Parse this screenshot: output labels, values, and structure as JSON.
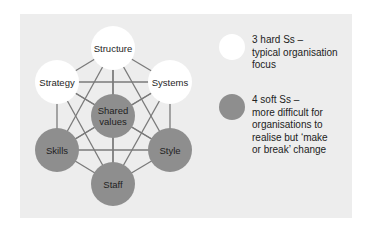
{
  "colors": {
    "panel_bg": "#ededed",
    "hard_fill": "#ffffff",
    "soft_fill": "#8e8e8e",
    "line": "#7a7a7a"
  },
  "diagram": {
    "nodes": [
      {
        "id": "structure",
        "label": "Structure",
        "type": "hard",
        "cx": 113,
        "cy": 48
      },
      {
        "id": "strategy",
        "label": "Strategy",
        "type": "hard",
        "cx": 57,
        "cy": 82
      },
      {
        "id": "systems",
        "label": "Systems",
        "type": "hard",
        "cx": 170,
        "cy": 82
      },
      {
        "id": "shared-values",
        "label": "Shared\nvalues",
        "type": "soft",
        "cx": 113,
        "cy": 116
      },
      {
        "id": "skills",
        "label": "Skills",
        "type": "soft",
        "cx": 57,
        "cy": 150
      },
      {
        "id": "style",
        "label": "Style",
        "type": "soft",
        "cx": 170,
        "cy": 150
      },
      {
        "id": "staff",
        "label": "Staff",
        "type": "soft",
        "cx": 113,
        "cy": 184
      }
    ],
    "node_radius": 22,
    "edges": "all-pairs"
  },
  "legend": {
    "items": [
      {
        "type": "hard",
        "text": "3 hard Ss –\ntypical organisation\nfocus"
      },
      {
        "type": "soft",
        "text": "4 soft Ss –\nmore difficult for\norganisations to\nrealise but ‘make\nor break’ change"
      }
    ]
  }
}
